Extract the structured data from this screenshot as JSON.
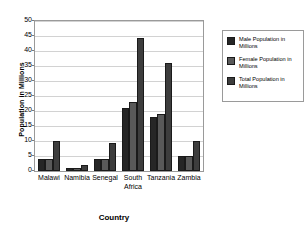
{
  "chart_data": {
    "type": "bar",
    "title": "",
    "xlabel": "Country",
    "ylabel": "Population in Millions",
    "categories": [
      "Malawi",
      "Namibia",
      "Senegal",
      "South Africa",
      "Tanzania",
      "Zambia"
    ],
    "series": [
      {
        "name": "Male Population in Millions",
        "values": [
          4,
          1,
          4,
          21,
          18,
          5
        ],
        "color": "#262626"
      },
      {
        "name": "Female Population in Millions",
        "values": [
          4,
          1,
          4,
          23,
          19,
          5
        ],
        "color": "#595959"
      },
      {
        "name": "Total Population in Millions",
        "values": [
          10,
          2,
          9.5,
          44.5,
          36,
          10
        ],
        "color": "#3d3d3d"
      }
    ],
    "ylim": [
      0,
      50
    ],
    "yticks": [
      0,
      5,
      10,
      15,
      20,
      25,
      30,
      35,
      40,
      45,
      50
    ],
    "ytick_labels": [
      "0",
      "5",
      "10",
      "15",
      "20",
      "25",
      "30",
      "35",
      "40",
      "45",
      "50"
    ],
    "grid": true,
    "legend_position": "right",
    "legend_entries": [
      "Male Population in Millions",
      "Female Population in Millions",
      "Total Population in Millions"
    ],
    "plot_background": "#FFFFFF",
    "gridline_color": "#D2D2D2",
    "frame_color": "#9A9A9A"
  }
}
